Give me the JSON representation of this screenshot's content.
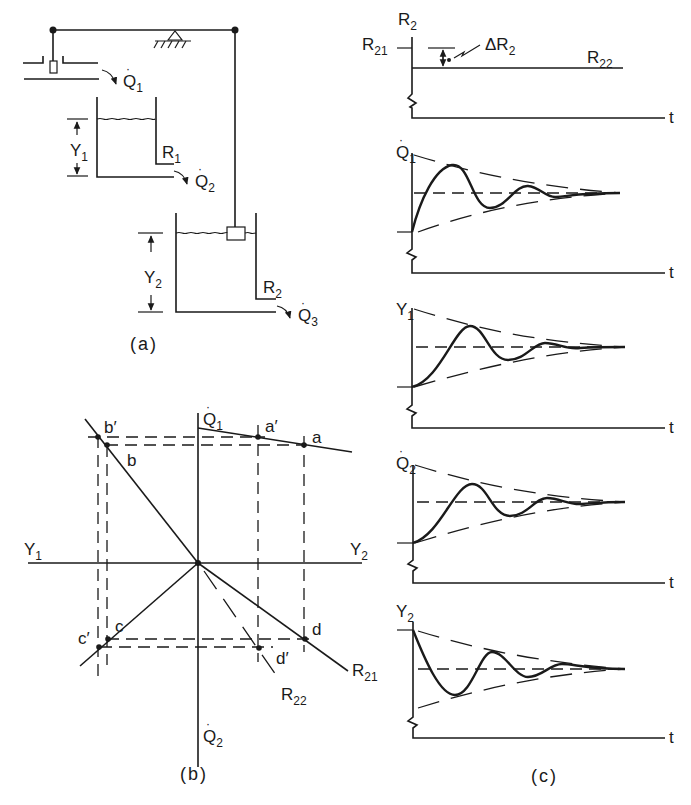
{
  "figure": {
    "panels": [
      {
        "id": "a",
        "caption": "(a)"
      },
      {
        "id": "b",
        "caption": "(b)"
      },
      {
        "id": "c",
        "caption": "(c)"
      }
    ]
  },
  "panel_a": {
    "caption": "(a)",
    "labels": {
      "q1": "Q",
      "q1_sub": "1",
      "q2": "Q",
      "q2_sub": "2",
      "q3": "Q",
      "q3_sub": "3",
      "y1": "Y",
      "y1_sub": "1",
      "y2": "Y",
      "y2_sub": "2",
      "r1": "R",
      "r1_sub": "1",
      "r2": "R",
      "r2_sub": "2"
    }
  },
  "panel_b": {
    "caption": "(b)",
    "axes": {
      "top": "Q",
      "top_sub": "1",
      "bottom": "Q",
      "bottom_sub": "2",
      "left": "Y",
      "left_sub": "1",
      "right": "Y",
      "right_sub": "2"
    },
    "points": {
      "a": "a",
      "a_prime": "a′",
      "b": "b",
      "b_prime": "b′",
      "c": "c",
      "c_prime": "c′",
      "d": "d",
      "d_prime": "d′"
    },
    "lines": {
      "r21": "R",
      "r21_sub": "21",
      "r22": "R",
      "r22_sub": "22"
    }
  },
  "panel_c": {
    "caption": "(c)",
    "time_label": "t",
    "plots": [
      {
        "ylabel": "R",
        "ylabel_sub": "2",
        "left_label": "R",
        "left_sub": "21",
        "right_label": "R",
        "right_sub": "22",
        "delta": "ΔR",
        "delta_sub": "2"
      },
      {
        "ylabel": "Q",
        "ylabel_sub": "1"
      },
      {
        "ylabel": "Y",
        "ylabel_sub": "1"
      },
      {
        "ylabel": "Q",
        "ylabel_sub": "2"
      },
      {
        "ylabel": "Y",
        "ylabel_sub": "2"
      }
    ]
  }
}
